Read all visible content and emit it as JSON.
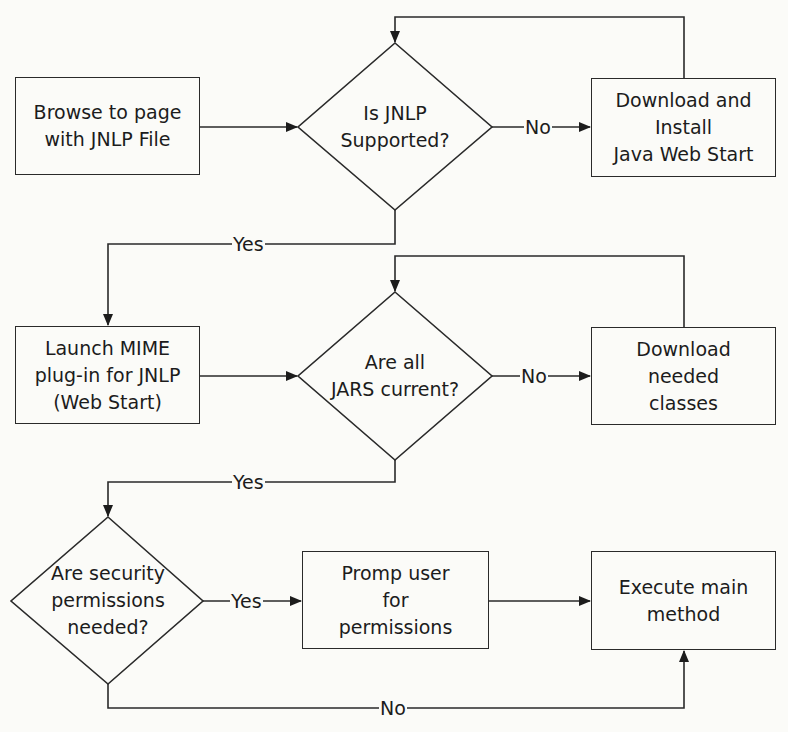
{
  "diagram": {
    "type": "flowchart",
    "nodes": {
      "browse": "Browse to page\nwith JNLP File",
      "jnlp_supported": "Is JNLP\nSupported?",
      "download_install": "Download and\nInstall\nJava Web Start",
      "launch_mime": "Launch MIME\nplug-in for JNLP\n(Web Start)",
      "jars_current": "Are all\nJARS current?",
      "download_classes": "Download\nneeded\nclasses",
      "security_needed": "Are security\npermissions\nneeded?",
      "prompt_user": "Promp user\nfor\npermissions",
      "execute_main": "Execute main\nmethod"
    },
    "edge_labels": {
      "jnlp_no": "No",
      "jnlp_yes": "Yes",
      "jars_no": "No",
      "jars_yes": "Yes",
      "security_yes": "Yes",
      "security_no": "No"
    },
    "edges": [
      {
        "from": "browse",
        "to": "jnlp_supported",
        "label": ""
      },
      {
        "from": "jnlp_supported",
        "to": "download_install",
        "label": "No"
      },
      {
        "from": "download_install",
        "to": "jnlp_supported",
        "label": ""
      },
      {
        "from": "jnlp_supported",
        "to": "launch_mime",
        "label": "Yes"
      },
      {
        "from": "launch_mime",
        "to": "jars_current",
        "label": ""
      },
      {
        "from": "jars_current",
        "to": "download_classes",
        "label": "No"
      },
      {
        "from": "download_classes",
        "to": "jars_current",
        "label": ""
      },
      {
        "from": "jars_current",
        "to": "security_needed",
        "label": "Yes"
      },
      {
        "from": "security_needed",
        "to": "prompt_user",
        "label": "Yes"
      },
      {
        "from": "prompt_user",
        "to": "execute_main",
        "label": ""
      },
      {
        "from": "security_needed",
        "to": "execute_main",
        "label": "No"
      }
    ]
  }
}
